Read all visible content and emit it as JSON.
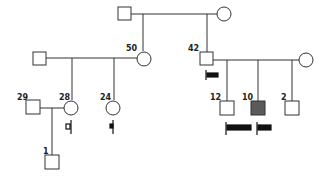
{
  "diagram": {
    "type": "pedigree",
    "colors": {
      "line": "#333333",
      "affected_fill": "#555555",
      "bar": "#111111"
    },
    "individuals": [
      {
        "id": "g1-father",
        "sex": "male",
        "label": ""
      },
      {
        "id": "g1-mother",
        "sex": "female",
        "label": ""
      },
      {
        "id": "g2-spouse-left",
        "sex": "male",
        "label": ""
      },
      {
        "id": "g2-daughter",
        "sex": "female",
        "label": "50"
      },
      {
        "id": "g2-son",
        "sex": "male",
        "label": "42"
      },
      {
        "id": "g2-spouse-right",
        "sex": "female",
        "label": ""
      },
      {
        "id": "g3-husband",
        "sex": "male",
        "label": "29"
      },
      {
        "id": "g3-daughter-a",
        "sex": "female",
        "label": "28"
      },
      {
        "id": "g3-daughter-b",
        "sex": "female",
        "label": "24"
      },
      {
        "id": "g3-son-a",
        "sex": "male",
        "label": "12"
      },
      {
        "id": "g3-son-b",
        "sex": "male",
        "label": "10",
        "affected": true
      },
      {
        "id": "g3-son-c",
        "sex": "male",
        "label": "2"
      },
      {
        "id": "g4-son",
        "sex": "male",
        "label": "1"
      }
    ],
    "labels": {
      "g2_daughter": "50",
      "g2_son": "42",
      "g3_husband": "29",
      "g3_daughter_a": "28",
      "g3_daughter_b": "24",
      "g3_son_a": "12",
      "g3_son_b": "10",
      "g3_son_c": "2",
      "g4_son": "1"
    }
  }
}
